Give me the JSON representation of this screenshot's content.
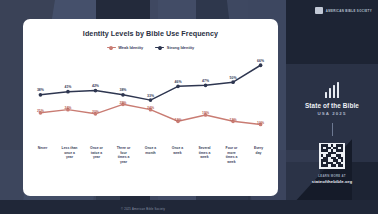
{
  "header": {
    "logo_icon": "abs-logo-icon",
    "logo_text": "AMERICAN BIBLE SOCIETY"
  },
  "card": {
    "title": "Identity Levels by Bible Use Frequency"
  },
  "brand": {
    "logo_icon": "bar-chart-logo-icon",
    "title": "State of the Bible",
    "subtitle": "USA 2025",
    "qr_icon": "qr-code-icon",
    "cta": "LEARN MORE AT",
    "url": "stateofthebible.org"
  },
  "footer": {
    "note": "© 2025 American Bible Society"
  },
  "chart_data": {
    "type": "line",
    "title": "Identity Levels by Bible Use Frequency",
    "xlabel": "",
    "ylabel": "",
    "ylim": [
      0,
      70
    ],
    "grid": false,
    "legend_position": "top",
    "categories": [
      "Never",
      "Less than once a year",
      "Once or twice a year",
      "Three or four times a year",
      "Once a month",
      "Once a week",
      "Several times a week",
      "Four or more times a week",
      "Every day"
    ],
    "category_lines": [
      [
        "Never"
      ],
      [
        "Less than",
        "once a",
        "year"
      ],
      [
        "Once or",
        "twice a",
        "year"
      ],
      [
        "Three or",
        "four",
        "times a",
        "year"
      ],
      [
        "Once a",
        "month"
      ],
      [
        "Once a",
        "week"
      ],
      [
        "Several",
        "times a",
        "week"
      ],
      [
        "Four or",
        "more",
        "times a",
        "week"
      ],
      [
        "Every",
        "day"
      ]
    ],
    "series": [
      {
        "name": "Weak Identity",
        "color": "#c97c73",
        "values": [
          21,
          24,
          20,
          29,
          24,
          13,
          19,
          13,
          10
        ],
        "labels": [
          "21%",
          "24%",
          "20%",
          "29%",
          "24%",
          "13%",
          "19%",
          "13%",
          "10%"
        ]
      },
      {
        "name": "Strong Identity",
        "color": "#2e3650",
        "values": [
          38,
          41,
          42,
          38,
          33,
          46,
          47,
          50,
          66
        ],
        "labels": [
          "38%",
          "41%",
          "42%",
          "38%",
          "33%",
          "46%",
          "47%",
          "50%",
          "66%"
        ]
      }
    ]
  }
}
